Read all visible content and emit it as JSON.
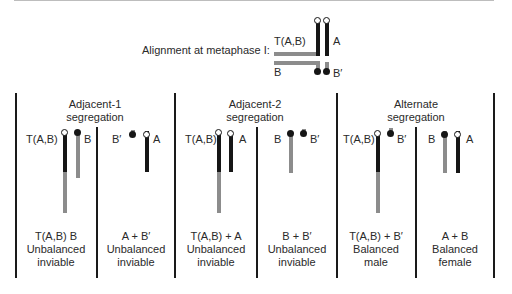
{
  "metaphase": {
    "label": "Alignment at metaphase I:",
    "chromosome_labels": {
      "tab": "T(A,B)",
      "a": "A",
      "b": "B",
      "bprime": "B′"
    }
  },
  "colors": {
    "chromatin_a": "#161616",
    "chromatin_b": "#8c8c8c",
    "divider": "#1a1a1a"
  },
  "segregations": [
    {
      "title_line1": "Adjacent-1",
      "title_line2": "segregation",
      "gametes": [
        {
          "labels": [
            "T(A,B)",
            "B"
          ],
          "caption_line1": "T(A,B)   B",
          "caption_line2": "Unbalanced",
          "caption_line3": "inviable"
        },
        {
          "labels": [
            "B′",
            "A"
          ],
          "caption_line1": "A + B′",
          "caption_line2": "Unbalanced",
          "caption_line3": "inviable"
        }
      ]
    },
    {
      "title_line1": "Adjacent-2",
      "title_line2": "segregation",
      "gametes": [
        {
          "labels": [
            "T(A,B)",
            "A"
          ],
          "caption_line1": "T(A,B) + A",
          "caption_line2": "Unbalanced",
          "caption_line3": "inviable"
        },
        {
          "labels": [
            "B",
            "B′"
          ],
          "caption_line1": "B + B′",
          "caption_line2": "Unbalanced",
          "caption_line3": "inviable"
        }
      ]
    },
    {
      "title_line1": "Alternate",
      "title_line2": "segregation",
      "gametes": [
        {
          "labels": [
            "T(A,B)",
            "B′"
          ],
          "caption_line1": "T(A,B) + B′",
          "caption_line2": "Balanced",
          "caption_line3": "male"
        },
        {
          "labels": [
            "B",
            "A"
          ],
          "caption_line1": "A + B",
          "caption_line2": "Balanced",
          "caption_line3": "female"
        }
      ]
    }
  ]
}
